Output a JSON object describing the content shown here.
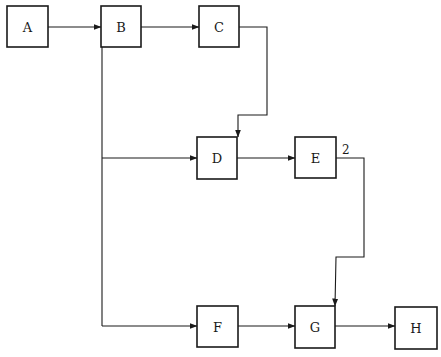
{
  "diagram": {
    "type": "flowchart",
    "nodes": [
      {
        "id": "A",
        "label": "A",
        "x": 7,
        "y": 6,
        "w": 41,
        "h": 41
      },
      {
        "id": "B",
        "label": "B",
        "x": 101,
        "y": 6,
        "w": 40,
        "h": 41
      },
      {
        "id": "C",
        "label": "C",
        "x": 199,
        "y": 6,
        "w": 40,
        "h": 41
      },
      {
        "id": "D",
        "label": "D",
        "x": 197,
        "y": 137,
        "w": 40,
        "h": 42
      },
      {
        "id": "E",
        "label": "E",
        "x": 295,
        "y": 137,
        "w": 41,
        "h": 41
      },
      {
        "id": "F",
        "label": "F",
        "x": 197,
        "y": 306,
        "w": 41,
        "h": 41
      },
      {
        "id": "G",
        "label": "G",
        "x": 295,
        "y": 306,
        "w": 40,
        "h": 42
      },
      {
        "id": "H",
        "label": "H",
        "x": 395,
        "y": 307,
        "w": 42,
        "h": 42
      }
    ],
    "edges": [
      {
        "from": "A",
        "to": "B",
        "label": ""
      },
      {
        "from": "B",
        "to": "C",
        "label": ""
      },
      {
        "from": "C",
        "to": "D",
        "label": ""
      },
      {
        "from": "B",
        "to": "D",
        "label": ""
      },
      {
        "from": "D",
        "to": "E",
        "label": ""
      },
      {
        "from": "E",
        "to": "G",
        "label": "2"
      },
      {
        "from": "B",
        "to": "F",
        "label": ""
      },
      {
        "from": "F",
        "to": "G",
        "label": ""
      },
      {
        "from": "G",
        "to": "H",
        "label": ""
      }
    ]
  }
}
